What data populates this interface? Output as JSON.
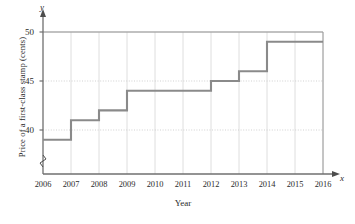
{
  "chart_data": {
    "type": "line",
    "subtype": "step",
    "title": "",
    "xlabel": "Year",
    "ylabel": "Price of a first-class stamp (cents)",
    "x_var_symbol": "x",
    "y_var_symbol": "y",
    "categories": [
      2006,
      2007,
      2008,
      2009,
      2010,
      2011,
      2012,
      2013,
      2014,
      2015,
      2016
    ],
    "values": [
      39,
      41,
      42,
      44,
      44,
      44,
      45,
      46,
      49,
      49,
      49
    ],
    "steps": [
      {
        "year_start": 2006,
        "year_end": 2007,
        "value": 39
      },
      {
        "year_start": 2007,
        "year_end": 2008,
        "value": 41
      },
      {
        "year_start": 2008,
        "year_end": 2009,
        "value": 42
      },
      {
        "year_start": 2009,
        "year_end": 2012,
        "value": 44
      },
      {
        "year_start": 2012,
        "year_end": 2013,
        "value": 45
      },
      {
        "year_start": 2013,
        "year_end": 2014,
        "value": 46
      },
      {
        "year_start": 2014,
        "year_end": 2016,
        "value": 49
      }
    ],
    "xlim": [
      2006,
      2016
    ],
    "ylim": [
      37.5,
      50
    ],
    "xticks": [
      "2006",
      "2007",
      "2008",
      "2009",
      "2010",
      "2011",
      "2012",
      "2013",
      "2014",
      "2015",
      "2016"
    ],
    "yticks": [
      "40",
      "45",
      "50"
    ],
    "ytick_values": [
      40,
      45,
      50
    ],
    "grid": "both",
    "y_axis_break": true,
    "legend": null,
    "colors": {
      "step_line": "#8a8a8a",
      "axis": "#6f6f6f",
      "grid_horizontal": "#cccccc",
      "grid_vertical": "#d6d6d6",
      "text": "#2b2b2b",
      "background": "#ffffff"
    }
  }
}
